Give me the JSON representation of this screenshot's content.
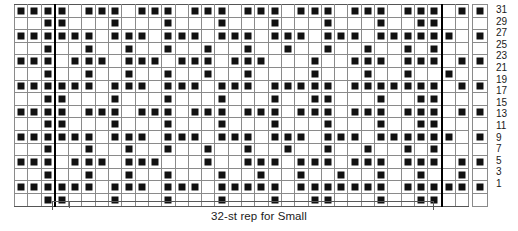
{
  "chart_data": {
    "type": "heatmap",
    "title": "",
    "xlabel": "",
    "ylabel": "",
    "grid_rows": 16,
    "grid_cols": 34,
    "legend_entries": [
      {
        "symbol": "filled-square",
        "label": ""
      },
      {
        "symbol": "empty-square",
        "label": ""
      }
    ],
    "row_numbers": [
      31,
      29,
      27,
      25,
      23,
      21,
      19,
      17,
      15,
      13,
      11,
      9,
      7,
      5,
      3,
      1
    ],
    "repeat_start_col": 3,
    "repeat_end_col": 31,
    "key_column": [
      1,
      0,
      1,
      0,
      1,
      0,
      1,
      0,
      1,
      0,
      1,
      0,
      1,
      0,
      1,
      0
    ],
    "cells": [
      [
        1,
        1,
        1,
        1,
        0,
        1,
        1,
        1,
        0,
        1,
        1,
        1,
        0,
        1,
        1,
        1,
        0,
        1,
        1,
        1,
        0,
        1,
        1,
        1,
        0,
        1,
        1,
        1,
        0,
        1,
        1,
        1,
        0,
        1
      ],
      [
        0,
        0,
        1,
        1,
        0,
        0,
        0,
        1,
        0,
        0,
        0,
        1,
        0,
        0,
        0,
        1,
        0,
        0,
        0,
        1,
        0,
        0,
        0,
        1,
        0,
        0,
        0,
        1,
        0,
        0,
        1,
        1,
        0,
        0
      ],
      [
        1,
        1,
        1,
        1,
        1,
        1,
        0,
        1,
        1,
        1,
        0,
        1,
        1,
        1,
        0,
        1,
        1,
        1,
        0,
        1,
        1,
        1,
        0,
        1,
        1,
        1,
        0,
        1,
        1,
        1,
        1,
        1,
        1,
        0
      ],
      [
        0,
        0,
        1,
        0,
        0,
        1,
        0,
        0,
        1,
        0,
        0,
        1,
        0,
        0,
        1,
        0,
        0,
        1,
        0,
        0,
        1,
        0,
        0,
        1,
        0,
        0,
        1,
        0,
        0,
        1,
        0,
        1,
        0,
        0
      ],
      [
        1,
        1,
        1,
        0,
        1,
        1,
        1,
        0,
        1,
        1,
        1,
        0,
        1,
        1,
        1,
        0,
        1,
        1,
        1,
        0,
        0,
        0,
        1,
        0,
        0,
        1,
        1,
        1,
        0,
        1,
        1,
        1,
        0,
        1
      ],
      [
        0,
        0,
        1,
        0,
        0,
        1,
        0,
        0,
        1,
        0,
        0,
        1,
        0,
        0,
        1,
        0,
        0,
        1,
        0,
        0,
        0,
        0,
        1,
        0,
        0,
        0,
        1,
        0,
        0,
        1,
        0,
        0,
        1,
        0
      ],
      [
        1,
        1,
        1,
        1,
        1,
        1,
        0,
        1,
        1,
        1,
        0,
        1,
        1,
        1,
        0,
        1,
        1,
        1,
        0,
        1,
        1,
        1,
        1,
        1,
        0,
        1,
        1,
        1,
        1,
        1,
        1,
        1,
        0,
        1
      ],
      [
        0,
        0,
        1,
        1,
        0,
        0,
        0,
        1,
        0,
        0,
        0,
        1,
        0,
        0,
        0,
        1,
        0,
        0,
        0,
        1,
        0,
        0,
        1,
        1,
        0,
        0,
        0,
        1,
        0,
        0,
        1,
        1,
        0,
        0
      ],
      [
        1,
        1,
        1,
        1,
        0,
        1,
        1,
        1,
        0,
        1,
        1,
        1,
        0,
        1,
        1,
        1,
        0,
        1,
        1,
        1,
        0,
        1,
        1,
        1,
        0,
        1,
        1,
        1,
        0,
        1,
        1,
        1,
        0,
        1
      ],
      [
        0,
        0,
        1,
        1,
        0,
        0,
        0,
        1,
        0,
        0,
        0,
        1,
        0,
        0,
        0,
        1,
        0,
        0,
        0,
        1,
        0,
        0,
        0,
        1,
        0,
        0,
        0,
        1,
        0,
        0,
        1,
        1,
        0,
        0
      ],
      [
        1,
        1,
        1,
        1,
        1,
        1,
        0,
        1,
        1,
        1,
        0,
        1,
        1,
        1,
        0,
        1,
        1,
        1,
        0,
        1,
        1,
        1,
        0,
        1,
        1,
        1,
        0,
        1,
        1,
        1,
        1,
        1,
        1,
        0
      ],
      [
        0,
        0,
        1,
        0,
        0,
        1,
        0,
        0,
        1,
        0,
        0,
        1,
        0,
        0,
        1,
        0,
        0,
        1,
        0,
        0,
        1,
        0,
        0,
        1,
        0,
        0,
        1,
        0,
        0,
        1,
        0,
        1,
        0,
        0
      ],
      [
        1,
        1,
        1,
        0,
        1,
        1,
        1,
        0,
        1,
        1,
        1,
        0,
        0,
        0,
        1,
        0,
        0,
        1,
        1,
        1,
        0,
        1,
        1,
        1,
        0,
        1,
        1,
        1,
        0,
        1,
        1,
        1,
        0,
        1
      ],
      [
        0,
        0,
        1,
        0,
        0,
        1,
        0,
        0,
        1,
        0,
        0,
        1,
        0,
        0,
        0,
        1,
        0,
        0,
        1,
        0,
        0,
        1,
        0,
        0,
        1,
        0,
        0,
        1,
        0,
        0,
        1,
        0,
        0,
        1
      ],
      [
        1,
        1,
        1,
        1,
        1,
        1,
        0,
        1,
        1,
        1,
        0,
        1,
        1,
        1,
        0,
        1,
        1,
        1,
        1,
        1,
        0,
        1,
        1,
        1,
        1,
        1,
        1,
        1,
        0,
        1,
        1,
        1,
        1,
        1
      ],
      [
        0,
        0,
        1,
        1,
        0,
        0,
        0,
        1,
        0,
        0,
        0,
        1,
        0,
        0,
        0,
        1,
        0,
        0,
        0,
        1,
        0,
        0,
        1,
        1,
        0,
        0,
        0,
        1,
        0,
        0,
        1,
        1,
        0,
        0
      ]
    ]
  },
  "bracket": {
    "label": "32-st rep for Small"
  }
}
